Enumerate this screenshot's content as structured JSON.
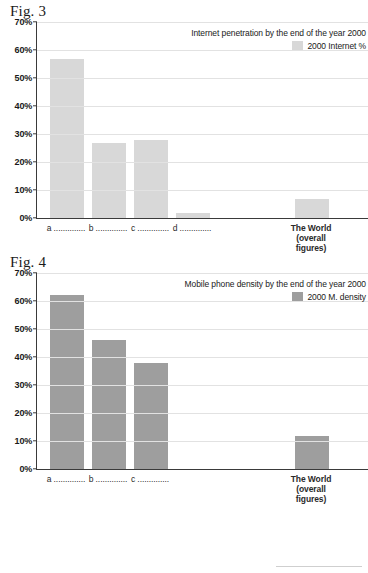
{
  "chart_data": [
    {
      "type": "bar",
      "figure_caption": "Fig. 3",
      "title": "Internet penetration by the end of the year 2000",
      "legend": [
        {
          "name": "2000 Internet %",
          "color": "#d8d8d8"
        }
      ],
      "legend_position": "top-right",
      "grid": true,
      "xlabel": "",
      "ylabel": "",
      "ylim": [
        0,
        70
      ],
      "ytick_labels": [
        "0%",
        "10%",
        "20%",
        "30%",
        "40%",
        "50%",
        "60%",
        "70%"
      ],
      "ytick_values": [
        0,
        10,
        20,
        30,
        40,
        50,
        60,
        70
      ],
      "categories": [
        "a ..............",
        "b ..............",
        "c ..............",
        "d ..............",
        "The World\n(overall\nfigures)"
      ],
      "values": [
        56.8,
        26.7,
        27.7,
        1.6,
        6.6
      ],
      "bar_color": "#d8d8d8"
    },
    {
      "type": "bar",
      "figure_caption": "Fig. 4",
      "title": "Mobile phone density by the end of the year 2000",
      "legend": [
        {
          "name": "2000 M. density",
          "color": "#9e9e9e"
        }
      ],
      "legend_position": "top-right",
      "grid": true,
      "xlabel": "",
      "ylabel": "",
      "ylim": [
        0,
        70
      ],
      "ytick_labels": [
        "0%",
        "10%",
        "20%",
        "30%",
        "40%",
        "50%",
        "60%",
        "70%"
      ],
      "ytick_values": [
        0,
        10,
        20,
        30,
        40,
        50,
        60,
        70
      ],
      "categories": [
        "a ..............",
        "b ..............",
        "c ..............",
        "The World\n(overall\nfigures)"
      ],
      "values": [
        61.8,
        45.8,
        37.8,
        11.6
      ],
      "bar_color": "#9e9e9e"
    }
  ],
  "fig3": {
    "caption": "Fig. 3",
    "legend_title": "Internet penetration by the end of the year 2000",
    "legend_label": "2000 Internet %",
    "yticks": [
      "70%",
      "60%",
      "50%",
      "40%",
      "30%",
      "20%",
      "10%",
      "0%"
    ],
    "xlabels": [
      "a ..............",
      "b ..............",
      "c ..............",
      "d ..............",
      "The World\n(overall\nfigures)"
    ]
  },
  "fig4": {
    "caption": "Fig. 4",
    "legend_title": "Mobile phone density by the end of the year 2000",
    "legend_label": "2000 M. density",
    "yticks": [
      "70%",
      "60%",
      "50%",
      "40%",
      "30%",
      "20%",
      "10%",
      "0%"
    ],
    "xlabels": [
      "a ..............",
      "b ..............",
      "c ..............",
      "The World\n(overall\nfigures)"
    ]
  },
  "colors": {
    "fig3_bar": "#d8d8d8",
    "fig4_bar": "#9e9e9e",
    "grid": "#e2e2e2",
    "axis": "#3a3a3a"
  }
}
